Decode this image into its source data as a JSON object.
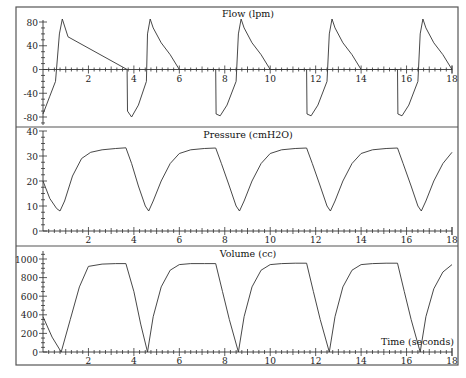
{
  "chart_data": [
    {
      "type": "line",
      "title": "Flow (lpm)",
      "xlabel": "",
      "ylabel": "",
      "xlim": [
        0,
        18
      ],
      "ylim": [
        -90,
        100
      ],
      "yticks": [
        80,
        40,
        0,
        -40,
        -80
      ],
      "ytick_labels": [
        "80",
        "40",
        "0",
        "-40",
        "-80"
      ],
      "xticks": [
        2,
        4,
        6,
        8,
        10,
        12,
        14,
        16,
        18
      ],
      "xtick_labels": [
        "2",
        "4",
        "6",
        "8",
        "10",
        "12",
        "14",
        "16",
        "18"
      ],
      "x_axis_at": 0,
      "grid": false,
      "series": [
        {
          "name": "Flow",
          "x": [
            0.0,
            0.3,
            0.55,
            0.72,
            0.85,
            1.1,
            3.7,
            3.72,
            3.9,
            4.2,
            4.55,
            4.6,
            4.72,
            4.85,
            5.2,
            5.6,
            6.0,
            7.6,
            7.62,
            7.8,
            8.1,
            8.5,
            8.6,
            8.72,
            8.85,
            9.2,
            9.6,
            10.0,
            11.6,
            11.62,
            11.8,
            12.1,
            12.5,
            12.6,
            12.72,
            12.85,
            13.2,
            13.6,
            14.0,
            15.6,
            15.62,
            15.8,
            16.1,
            16.5,
            16.6,
            16.72,
            16.85,
            17.2,
            17.6,
            18.0
          ],
          "y": [
            -75,
            -45,
            -20,
            60,
            85,
            55,
            0,
            -70,
            -80,
            -60,
            -20,
            60,
            85,
            70,
            45,
            25,
            0,
            0,
            -75,
            -78,
            -60,
            -20,
            60,
            85,
            70,
            45,
            25,
            0,
            0,
            -75,
            -78,
            -60,
            -20,
            60,
            85,
            70,
            45,
            25,
            0,
            0,
            -75,
            -78,
            -60,
            -20,
            60,
            85,
            70,
            45,
            25,
            0
          ]
        }
      ]
    },
    {
      "type": "line",
      "title": "Pressure (cmH2O)",
      "xlabel": "",
      "ylabel": "",
      "xlim": [
        0,
        18
      ],
      "ylim": [
        0,
        40
      ],
      "yticks": [
        40,
        30,
        20,
        10,
        0
      ],
      "ytick_labels": [
        "40",
        "30",
        "20",
        "10",
        "0"
      ],
      "xticks": [
        2,
        4,
        6,
        8,
        10,
        12,
        14,
        16,
        18
      ],
      "xtick_labels": [
        "2",
        "4",
        "6",
        "8",
        "10",
        "12",
        "14",
        "16",
        "18"
      ],
      "grid": false,
      "series": [
        {
          "name": "Pressure",
          "x": [
            0.0,
            0.3,
            0.6,
            0.75,
            0.95,
            1.3,
            1.7,
            2.1,
            2.6,
            3.2,
            3.65,
            3.9,
            4.2,
            4.5,
            4.65,
            4.85,
            5.2,
            5.6,
            6.0,
            6.5,
            7.1,
            7.6,
            7.85,
            8.2,
            8.5,
            8.65,
            8.85,
            9.2,
            9.6,
            10.0,
            10.5,
            11.1,
            11.6,
            11.85,
            12.2,
            12.5,
            12.65,
            12.85,
            13.2,
            13.6,
            14.0,
            14.5,
            15.1,
            15.6,
            15.85,
            16.2,
            16.5,
            16.65,
            16.85,
            17.2,
            17.6,
            18.0
          ],
          "y": [
            20,
            13,
            9,
            8,
            12,
            22,
            29,
            31.5,
            32.5,
            33,
            33.3,
            27,
            18,
            10,
            8,
            12,
            20,
            27,
            31,
            32.5,
            33,
            33.2,
            27,
            18,
            10,
            8,
            12,
            20,
            27,
            31,
            32.5,
            33,
            33.2,
            27,
            18,
            10,
            8,
            12,
            20,
            27,
            31,
            32.5,
            33,
            33.2,
            27,
            18,
            10,
            8,
            12,
            20,
            27,
            31.5
          ]
        }
      ]
    },
    {
      "type": "line",
      "title": "Volume (cc)",
      "xlabel": "Time (seconds)",
      "ylabel": "",
      "xlim": [
        0,
        18
      ],
      "ylim": [
        0,
        1100
      ],
      "yticks": [
        1000,
        800,
        600,
        400,
        200,
        0
      ],
      "ytick_labels": [
        "1000",
        "800",
        "600",
        "400",
        "200",
        "0"
      ],
      "xticks": [
        2,
        4,
        6,
        8,
        10,
        12,
        14,
        16,
        18
      ],
      "xtick_labels": [
        "2",
        "4",
        "6",
        "8",
        "10",
        "12",
        "14",
        "16",
        "18"
      ],
      "grid": false,
      "series": [
        {
          "name": "Volume",
          "x": [
            0.0,
            0.4,
            0.8,
            1.2,
            1.6,
            2.0,
            2.6,
            3.2,
            3.65,
            4.0,
            4.3,
            4.6,
            4.85,
            5.2,
            5.6,
            6.0,
            6.5,
            7.1,
            7.6,
            7.9,
            8.2,
            8.6,
            8.85,
            9.2,
            9.6,
            10.0,
            10.5,
            11.1,
            11.6,
            11.9,
            12.2,
            12.6,
            12.85,
            13.2,
            13.6,
            14.0,
            14.5,
            15.1,
            15.6,
            15.9,
            16.2,
            16.6,
            16.85,
            17.2,
            17.6,
            18.0
          ],
          "y": [
            380,
            160,
            0,
            350,
            700,
            920,
            945,
            950,
            950,
            650,
            300,
            0,
            380,
            700,
            880,
            940,
            950,
            950,
            950,
            650,
            350,
            0,
            380,
            700,
            880,
            940,
            950,
            955,
            955,
            650,
            350,
            0,
            380,
            700,
            880,
            940,
            950,
            955,
            955,
            650,
            350,
            0,
            380,
            680,
            860,
            940
          ]
        }
      ]
    }
  ]
}
